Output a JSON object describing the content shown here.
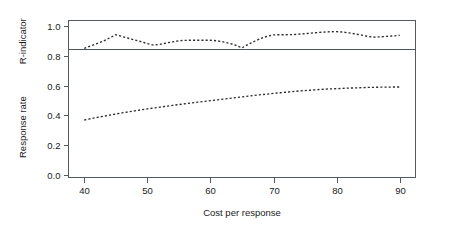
{
  "chart_data": {
    "type": "line",
    "title": "",
    "subtitle": "",
    "xlabel": "Cost per response",
    "ylabel": "",
    "ylabel_upper": "R-indicator",
    "ylabel_lower": "Response rate",
    "xlim": [
      37.5,
      92.5
    ],
    "ylim": [
      -0.02,
      1.04
    ],
    "grid": false,
    "legend": "none",
    "xticks": [
      40,
      50,
      60,
      70,
      80,
      90
    ],
    "xtick_labels": [
      "40",
      "50",
      "60",
      "70",
      "80",
      "90"
    ],
    "yticks": [
      0.0,
      0.2,
      0.4,
      0.6,
      0.8,
      1.0
    ],
    "ytick_labels": [
      "0.0",
      "0.2",
      "0.4",
      "0.6",
      "0.8",
      "1.0"
    ],
    "annotations": [
      {
        "name": "reference-line",
        "type": "hline",
        "y": 0.85,
        "style": "solid"
      }
    ],
    "series": [
      {
        "name": "R-indicator",
        "style": "dotted",
        "x": [
          40,
          41,
          42,
          43,
          44,
          45,
          46,
          47,
          48,
          49,
          50,
          51,
          52,
          53,
          54,
          55,
          56,
          57,
          58,
          59,
          60,
          61,
          62,
          63,
          64,
          65,
          66,
          67,
          68,
          69,
          70,
          71,
          72,
          73,
          74,
          75,
          76,
          77,
          78,
          79,
          80,
          81,
          82,
          83,
          84,
          85,
          86,
          87,
          88,
          89,
          90
        ],
        "values": [
          0.852,
          0.868,
          0.884,
          0.901,
          0.922,
          0.944,
          0.932,
          0.92,
          0.908,
          0.897,
          0.884,
          0.874,
          0.879,
          0.888,
          0.896,
          0.903,
          0.906,
          0.907,
          0.907,
          0.907,
          0.907,
          0.903,
          0.896,
          0.886,
          0.873,
          0.855,
          0.879,
          0.9,
          0.919,
          0.934,
          0.943,
          0.944,
          0.944,
          0.945,
          0.948,
          0.951,
          0.955,
          0.959,
          0.962,
          0.964,
          0.965,
          0.962,
          0.956,
          0.949,
          0.941,
          0.932,
          0.928,
          0.93,
          0.933,
          0.936,
          0.94
        ]
      },
      {
        "name": "Response rate",
        "style": "dotted",
        "x": [
          40,
          41,
          42,
          43,
          44,
          45,
          46,
          47,
          48,
          49,
          50,
          51,
          52,
          53,
          54,
          55,
          56,
          57,
          58,
          59,
          60,
          61,
          62,
          63,
          64,
          65,
          66,
          67,
          68,
          69,
          70,
          71,
          72,
          73,
          74,
          75,
          76,
          77,
          78,
          79,
          80,
          81,
          82,
          83,
          84,
          85,
          86,
          87,
          88,
          89,
          90
        ],
        "values": [
          0.368,
          0.377,
          0.385,
          0.393,
          0.401,
          0.409,
          0.416,
          0.423,
          0.43,
          0.437,
          0.443,
          0.449,
          0.455,
          0.461,
          0.467,
          0.472,
          0.478,
          0.483,
          0.489,
          0.494,
          0.499,
          0.504,
          0.509,
          0.514,
          0.519,
          0.524,
          0.529,
          0.534,
          0.539,
          0.543,
          0.548,
          0.552,
          0.556,
          0.56,
          0.564,
          0.567,
          0.57,
          0.573,
          0.576,
          0.578,
          0.58,
          0.582,
          0.584,
          0.585,
          0.587,
          0.588,
          0.589,
          0.59,
          0.59,
          0.591,
          0.591
        ]
      }
    ]
  }
}
